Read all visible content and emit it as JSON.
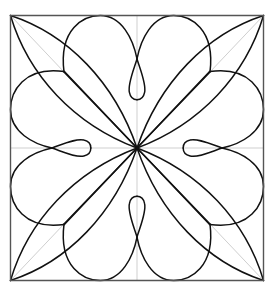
{
  "figure": {
    "colors": {
      "background": "#ffffff",
      "line": "#111111",
      "frame": "#555555",
      "guide": "#cfcfcf"
    },
    "symmetry": "8-fold (dihedral, square)",
    "elements": {
      "corner_leaves": 4,
      "heart_lobe_pairs": 4,
      "axis_loops": 4,
      "guide_lines": [
        "horizontal axis",
        "vertical axis",
        "diagonal top-left",
        "diagonal top-right",
        "diagonal bottom-left",
        "diagonal bottom-right"
      ]
    }
  }
}
